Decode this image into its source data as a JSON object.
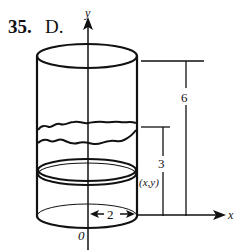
{
  "problem": {
    "number": "35.",
    "answer": "D."
  },
  "axes": {
    "y_label": "y",
    "x_label": "x",
    "origin_label": "0"
  },
  "dimensions": {
    "total_height": "6",
    "water_height": "3",
    "radius": "2",
    "point_label": "(x,y)"
  },
  "colors": {
    "ink": "#111111",
    "background": "#ffffff"
  }
}
